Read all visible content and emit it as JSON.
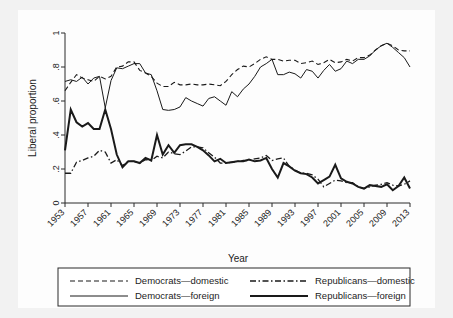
{
  "figure": {
    "background_color": "#f2f2f2",
    "panel_color": "#fdfdfd"
  },
  "chart_data": {
    "type": "line",
    "title": "",
    "xlabel": "Year",
    "ylabel": "Liberal proportion",
    "xlim": [
      1953,
      2013
    ],
    "ylim": [
      0,
      1
    ],
    "grid": false,
    "legend_position": "below-axes",
    "ytick_labels": [
      "0",
      ".2",
      ".4",
      ".6",
      ".8",
      "1"
    ],
    "ytick_values": [
      0,
      0.2,
      0.4,
      0.6,
      0.8,
      1
    ],
    "xtick_labels": [
      "1953",
      "1957",
      "1961",
      "1965",
      "1969",
      "1973",
      "1977",
      "1981",
      "1985",
      "1989",
      "1993",
      "1997",
      "2001",
      "2005",
      "2009",
      "2013"
    ],
    "xtick_values": [
      1953,
      1957,
      1961,
      1965,
      1969,
      1973,
      1977,
      1981,
      1985,
      1989,
      1993,
      1997,
      2001,
      2005,
      2009,
      2013
    ],
    "x": [
      1953,
      1954,
      1955,
      1956,
      1957,
      1958,
      1959,
      1960,
      1961,
      1962,
      1963,
      1964,
      1965,
      1966,
      1967,
      1968,
      1969,
      1970,
      1971,
      1972,
      1973,
      1974,
      1975,
      1976,
      1977,
      1978,
      1979,
      1980,
      1981,
      1982,
      1983,
      1984,
      1985,
      1986,
      1987,
      1988,
      1989,
      1990,
      1991,
      1992,
      1993,
      1994,
      1995,
      1996,
      1997,
      1998,
      1999,
      2000,
      2001,
      2002,
      2003,
      2004,
      2005,
      2006,
      2007,
      2008,
      2009,
      2010,
      2011,
      2012,
      2013
    ],
    "series": [
      {
        "name": "Democrats—domestic",
        "style": "dashed",
        "values": [
          0.66,
          0.71,
          0.755,
          0.735,
          0.725,
          0.715,
          0.745,
          0.73,
          0.745,
          0.8,
          0.805,
          0.83,
          0.83,
          0.78,
          0.765,
          0.745,
          0.705,
          0.685,
          0.685,
          0.71,
          0.695,
          0.695,
          0.7,
          0.695,
          0.695,
          0.7,
          0.695,
          0.69,
          0.715,
          0.755,
          0.785,
          0.805,
          0.8,
          0.82,
          0.845,
          0.86,
          0.845,
          0.845,
          0.835,
          0.84,
          0.84,
          0.82,
          0.825,
          0.835,
          0.815,
          0.825,
          0.845,
          0.825,
          0.83,
          0.845,
          0.835,
          0.855,
          0.855,
          0.87,
          0.9,
          0.925,
          0.94,
          0.925,
          0.9,
          0.895,
          0.895
        ]
      },
      {
        "name": "Democrats—foreign",
        "style": "solid-thin",
        "values": [
          0.715,
          0.725,
          0.715,
          0.74,
          0.7,
          0.735,
          0.745,
          0.56,
          0.72,
          0.795,
          0.79,
          0.805,
          0.82,
          0.82,
          0.765,
          0.755,
          0.66,
          0.55,
          0.545,
          0.55,
          0.565,
          0.62,
          0.6,
          0.585,
          0.57,
          0.615,
          0.625,
          0.6,
          0.575,
          0.655,
          0.625,
          0.67,
          0.7,
          0.745,
          0.8,
          0.82,
          0.845,
          0.755,
          0.755,
          0.77,
          0.76,
          0.735,
          0.785,
          0.775,
          0.735,
          0.78,
          0.815,
          0.775,
          0.79,
          0.835,
          0.82,
          0.845,
          0.845,
          0.865,
          0.9,
          0.925,
          0.94,
          0.915,
          0.885,
          0.855,
          0.8
        ]
      },
      {
        "name": "Republicans—domestic",
        "style": "dash-dot",
        "values": [
          0.175,
          0.175,
          0.24,
          0.25,
          0.265,
          0.275,
          0.31,
          0.3,
          0.235,
          0.255,
          0.22,
          0.245,
          0.245,
          0.235,
          0.255,
          0.25,
          0.275,
          0.265,
          0.3,
          0.29,
          0.285,
          0.305,
          0.33,
          0.33,
          0.325,
          0.295,
          0.27,
          0.235,
          0.235,
          0.24,
          0.245,
          0.25,
          0.25,
          0.26,
          0.265,
          0.28,
          0.25,
          0.26,
          0.265,
          0.215,
          0.195,
          0.175,
          0.175,
          0.165,
          0.14,
          0.095,
          0.115,
          0.135,
          0.13,
          0.12,
          0.12,
          0.095,
          0.085,
          0.095,
          0.105,
          0.11,
          0.12,
          0.105,
          0.1,
          0.11,
          0.13
        ]
      },
      {
        "name": "Republicans—foreign",
        "style": "solid-thick",
        "values": [
          0.31,
          0.55,
          0.475,
          0.45,
          0.47,
          0.435,
          0.435,
          0.55,
          0.435,
          0.285,
          0.21,
          0.245,
          0.245,
          0.235,
          0.265,
          0.25,
          0.4,
          0.285,
          0.34,
          0.295,
          0.34,
          0.345,
          0.345,
          0.33,
          0.31,
          0.28,
          0.245,
          0.26,
          0.235,
          0.24,
          0.245,
          0.245,
          0.255,
          0.245,
          0.25,
          0.265,
          0.2,
          0.15,
          0.235,
          0.215,
          0.19,
          0.175,
          0.17,
          0.15,
          0.115,
          0.135,
          0.155,
          0.225,
          0.145,
          0.125,
          0.115,
          0.095,
          0.085,
          0.105,
          0.1,
          0.095,
          0.11,
          0.075,
          0.1,
          0.15,
          0.085
        ]
      }
    ]
  },
  "legend": {
    "entries": [
      {
        "label": "Democrats—domestic",
        "style": "dashed"
      },
      {
        "label": "Republicans—domestic",
        "style": "dash-dot"
      },
      {
        "label": "Democrats—foreign",
        "style": "solid-thin"
      },
      {
        "label": "Republicans—foreign",
        "style": "solid-thick"
      }
    ]
  }
}
